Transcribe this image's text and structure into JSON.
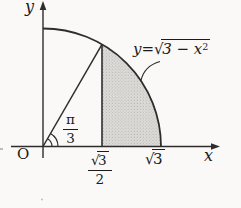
{
  "figure": {
    "title_semantic": "quarter-circle area diagram",
    "background_color": "#faf9f7",
    "line_color": "#2e2d2b",
    "shade_fill_color": "#dddcd9",
    "shade_dot_color": "#aaa9a6",
    "axes": {
      "x_label": "x",
      "y_label": "y",
      "origin_label": "O"
    },
    "equation": {
      "lhs": "y",
      "equals": "=",
      "radical": "√",
      "radicand": "3 − x",
      "exponent": "2"
    },
    "angle": {
      "numerator": "π",
      "denominator": "3"
    },
    "x_tick_half": {
      "radical": "√",
      "radicand": "3",
      "denominator": "2"
    },
    "x_tick_full": {
      "radical": "√",
      "radicand": "3"
    }
  }
}
